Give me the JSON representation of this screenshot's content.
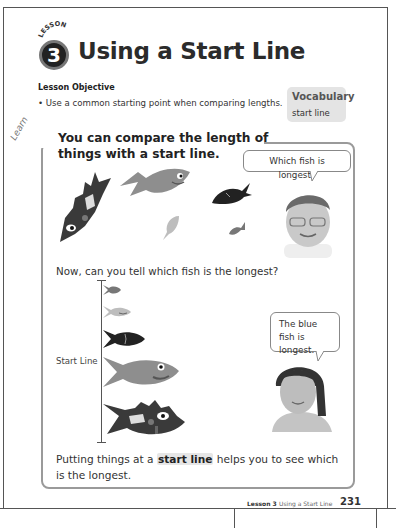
{
  "header": {
    "lesson_word": "LESSON",
    "lesson_number": "3",
    "title": "Using a Start Line"
  },
  "objective": {
    "heading": "Lesson Objective",
    "bullet": "• Use a common starting point when comparing lengths."
  },
  "vocabulary": {
    "heading": "Vocabulary",
    "term": "start line"
  },
  "learn": {
    "tag": "Learn",
    "heading": "You can compare the length of things with a start line.",
    "bubble_boy": "Which fish is longest?",
    "question": "Now, can you tell which fish is the longest?",
    "start_line_label": "Start Line",
    "bubble_girl": "The blue fish is longest.",
    "conclusion_pre": "Putting things at a ",
    "conclusion_term": "start line",
    "conclusion_post": " helps you to see which is the longest."
  },
  "footer": {
    "lesson": "Lesson 3",
    "title": "Using a Start Line",
    "page_number": "231"
  },
  "colors": {
    "blue_fish": "#8e8e8e",
    "dark_fish": "#3a3a3a",
    "highlight": "#e6e6e6",
    "box_border": "#9a9a9a"
  }
}
